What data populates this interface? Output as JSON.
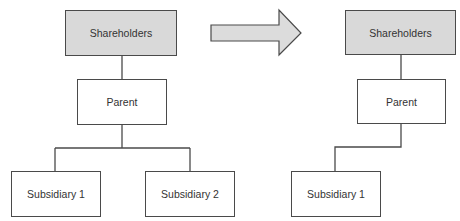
{
  "diagram": {
    "type": "org-chart-before-after",
    "colors": {
      "line": "#4a4a4a",
      "shaded_fill": "#d9d9d9",
      "plain_fill": "#ffffff",
      "arrow_fill": "#dcdcdc",
      "text": "#333333"
    },
    "before": {
      "nodes": [
        {
          "id": "shareholders",
          "label": "Shareholders",
          "shaded": true
        },
        {
          "id": "parent",
          "label": "Parent",
          "shaded": false
        },
        {
          "id": "subsidiary1",
          "label": "Subsidiary 1",
          "shaded": false
        },
        {
          "id": "subsidiary2",
          "label": "Subsidiary 2",
          "shaded": false
        }
      ],
      "edges": [
        {
          "from": "shareholders",
          "to": "parent"
        },
        {
          "from": "parent",
          "to": "subsidiary1"
        },
        {
          "from": "parent",
          "to": "subsidiary2"
        }
      ]
    },
    "transition": {
      "shape": "block-arrow",
      "direction": "right"
    },
    "after": {
      "nodes": [
        {
          "id": "shareholders",
          "label": "Shareholders",
          "shaded": true
        },
        {
          "id": "parent",
          "label": "Parent",
          "shaded": false
        },
        {
          "id": "subsidiary1",
          "label": "Subsidiary 1",
          "shaded": false
        }
      ],
      "edges": [
        {
          "from": "shareholders",
          "to": "parent"
        },
        {
          "from": "parent",
          "to": "subsidiary1"
        }
      ]
    }
  }
}
